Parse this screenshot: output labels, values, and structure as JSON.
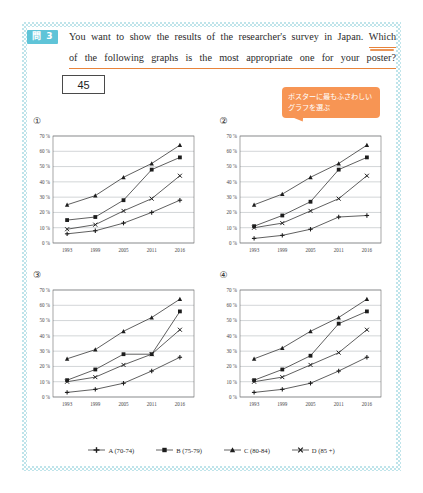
{
  "header": {
    "badge": "問 3",
    "question_line1": "You want to show the results of the researcher's survey in Japan.",
    "question_underlined_start": "Which",
    "question_line2": "of the following graphs is the most appropriate one for your poster?",
    "answer_box_value": "45"
  },
  "callout": {
    "line1": "ポスターに最もふさわしい",
    "line2": "グラフを選ぶ",
    "color": "#f79554"
  },
  "axes": {
    "x_ticks": [
      "1993",
      "1999",
      "2005",
      "2011",
      "2016"
    ],
    "y_ticks": [
      "0 %",
      "10 %",
      "20 %",
      "30 %",
      "40 %",
      "50 %",
      "60 %",
      "70 %"
    ],
    "ylim": [
      0,
      70
    ]
  },
  "legend": [
    {
      "label": "A (70-74)",
      "marker": "plus-line"
    },
    {
      "label": "B (75-79)",
      "marker": "square-line"
    },
    {
      "label": "C (80-84)",
      "marker": "triangle-line"
    },
    {
      "label": "D (85 +)",
      "marker": "cross-line"
    }
  ],
  "chart_data": [
    {
      "type": "line",
      "title": "①",
      "xlabel": "",
      "ylabel": "",
      "x": [
        "1993",
        "1999",
        "2005",
        "2011",
        "2016"
      ],
      "ylim": [
        0,
        70
      ],
      "grid": true,
      "legend_position": "bottom-shared",
      "series": [
        {
          "name": "A (70-74)",
          "values": [
            6,
            8,
            13,
            20,
            28
          ]
        },
        {
          "name": "B (75-79)",
          "values": [
            15,
            17,
            28,
            48,
            56
          ]
        },
        {
          "name": "C (80-84)",
          "values": [
            25,
            31,
            43,
            52,
            64
          ]
        },
        {
          "name": "D (85 +)",
          "values": [
            9,
            12,
            21,
            29,
            44
          ]
        }
      ]
    },
    {
      "type": "line",
      "title": "②",
      "xlabel": "",
      "ylabel": "",
      "x": [
        "1993",
        "1999",
        "2005",
        "2011",
        "2016"
      ],
      "ylim": [
        0,
        70
      ],
      "grid": true,
      "legend_position": "bottom-shared",
      "series": [
        {
          "name": "A (70-74)",
          "values": [
            3,
            5,
            9,
            17,
            18
          ]
        },
        {
          "name": "B (75-79)",
          "values": [
            11,
            18,
            27,
            48,
            56
          ]
        },
        {
          "name": "C (80-84)",
          "values": [
            25,
            32,
            43,
            52,
            64
          ]
        },
        {
          "name": "D (85 +)",
          "values": [
            10,
            13,
            21,
            29,
            44
          ]
        }
      ]
    },
    {
      "type": "line",
      "title": "③",
      "xlabel": "",
      "ylabel": "",
      "x": [
        "1993",
        "1999",
        "2005",
        "2011",
        "2016"
      ],
      "ylim": [
        0,
        70
      ],
      "grid": true,
      "legend_position": "bottom-shared",
      "series": [
        {
          "name": "A (70-74)",
          "values": [
            3,
            5,
            9,
            17,
            26
          ]
        },
        {
          "name": "B (75-79)",
          "values": [
            11,
            18,
            28,
            28,
            56
          ]
        },
        {
          "name": "C (80-84)",
          "values": [
            25,
            31,
            43,
            52,
            64
          ]
        },
        {
          "name": "D (85 +)",
          "values": [
            10,
            13,
            21,
            28,
            44
          ]
        }
      ]
    },
    {
      "type": "line",
      "title": "④",
      "xlabel": "",
      "ylabel": "",
      "x": [
        "1993",
        "1999",
        "2005",
        "2011",
        "2016"
      ],
      "ylim": [
        0,
        70
      ],
      "grid": true,
      "legend_position": "bottom-shared",
      "series": [
        {
          "name": "A (70-74)",
          "values": [
            3,
            5,
            9,
            17,
            26
          ]
        },
        {
          "name": "B (75-79)",
          "values": [
            11,
            18,
            27,
            48,
            56
          ]
        },
        {
          "name": "C (80-84)",
          "values": [
            25,
            32,
            43,
            52,
            64
          ]
        },
        {
          "name": "D (85 +)",
          "values": [
            10,
            13,
            21,
            29,
            44
          ]
        }
      ]
    }
  ]
}
